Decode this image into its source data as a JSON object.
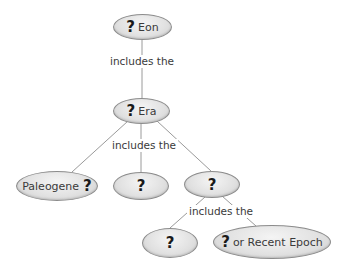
{
  "diagram": {
    "type": "concept-map",
    "colors": {
      "node_fill": "#e2e2e2",
      "node_border": "#8c8c8c",
      "line": "#9a9a9a",
      "text": "#3a3a3a"
    },
    "nodes": {
      "eon": {
        "q": "?",
        "text": "Eon"
      },
      "era": {
        "q": "?",
        "text": "Era"
      },
      "paleogene": {
        "text": "Paleogene",
        "q": "?"
      },
      "era_child_2": {
        "q": "?"
      },
      "era_child_3": {
        "q": "?"
      },
      "epoch_1": {
        "q": "?"
      },
      "epoch_2": {
        "q": "?",
        "text": "or Recent Epoch"
      }
    },
    "links": {
      "eon_era": "includes the",
      "era_children": "includes the",
      "period_epochs": "includes the"
    }
  }
}
